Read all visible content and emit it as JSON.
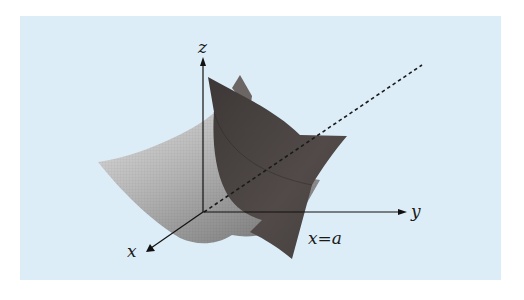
{
  "figure": {
    "background_color": "#dcedf7",
    "surface_light_color": "#b5b5b5",
    "plane_dark_color": "#4a4443",
    "axes": {
      "x_label": "x",
      "y_label": "y",
      "z_label": "z"
    },
    "plane_label": "x=a",
    "dashed_line": "dashed-guide-line"
  }
}
